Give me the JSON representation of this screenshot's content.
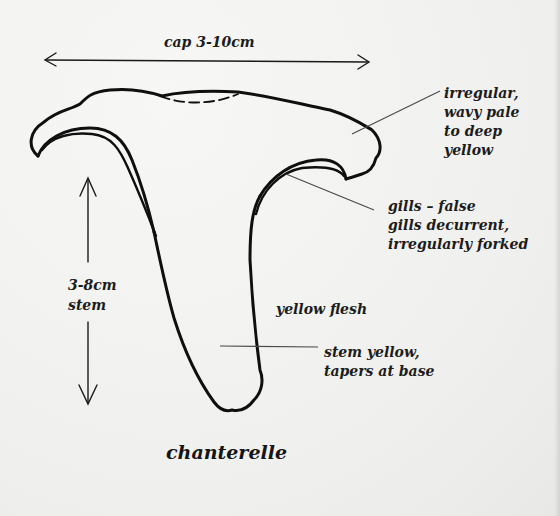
{
  "diagram": {
    "title": "chanterelle",
    "labels": {
      "cap_size": "cap 3-10cm",
      "stem_size_line1": "3-8cm",
      "stem_size_line2": "stem",
      "cap_description": "irregular,\nwavy pale\nto deep\nyellow",
      "gills_description": "gills – false\ngills decurrent,\nirregularly forked",
      "flesh_description": "yellow flesh",
      "stem_description": "stem yellow,\ntapers at base"
    },
    "colors": {
      "background": "#f2f2f0",
      "ink": "#111111"
    }
  }
}
